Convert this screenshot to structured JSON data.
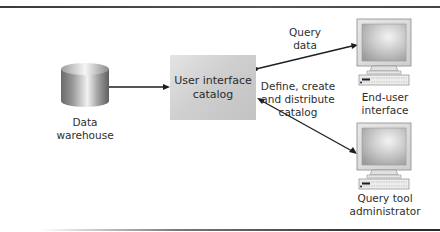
{
  "diagram": {
    "type": "data-flow",
    "nodes": {
      "data_warehouse": {
        "label_line1": "Data",
        "label_line2": "warehouse",
        "icon": "database-cylinder-icon"
      },
      "catalog": {
        "label_line1": "User interface",
        "label_line2": "catalog"
      },
      "end_user": {
        "label_line1": "End-user",
        "label_line2": "interface",
        "icon": "computer-monitor-icon"
      },
      "admin": {
        "label_line1": "Query tool",
        "label_line2": "administrator",
        "icon": "computer-monitor-icon"
      }
    },
    "edges": {
      "query_data": {
        "label_line1": "Query",
        "label_line2": "data",
        "from": "catalog",
        "to": "end_user"
      },
      "define_catalog": {
        "label_line1": "Define, create",
        "label_line2": "and distribute",
        "label_line3": "catalog",
        "from": "admin",
        "to": "catalog"
      },
      "warehouse_to_catalog": {
        "from": "data_warehouse",
        "to": "catalog"
      }
    },
    "colors": {
      "line": "#1e1e1e",
      "box_fill": "#cdcdcd",
      "text": "#2e2e2e"
    }
  }
}
